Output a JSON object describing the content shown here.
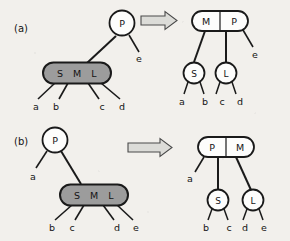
{
  "figure": {
    "colors": {
      "background": "#f2f0ec",
      "stroke": "#1a1a1a",
      "gray_node_fill": "#9c9c9c",
      "white_node_fill": "#fdfdfc",
      "arrow_fill": "#d8d8d4",
      "text": "#141414"
    },
    "panels": [
      {
        "id": "a",
        "label": "(a)",
        "arrow": "double-right-arrow",
        "arrow_glyph": "⟹",
        "before": {
          "nodes": [
            {
              "id": "a-before-p",
              "shape": "circle",
              "fill": "white",
              "keys": [
                "P"
              ]
            },
            {
              "id": "a-before-sml",
              "shape": "stadium",
              "fill": "gray",
              "keys": [
                "S",
                "M",
                "L"
              ]
            }
          ],
          "leaf_labels": [
            "a",
            "b",
            "c",
            "d"
          ],
          "side_labels": [
            "e"
          ]
        },
        "after": {
          "nodes": [
            {
              "id": "a-after-mp",
              "shape": "stadium",
              "fill": "white",
              "keys": [
                "M",
                "P"
              ]
            },
            {
              "id": "a-after-s",
              "shape": "circle",
              "fill": "white",
              "keys": [
                "S"
              ]
            },
            {
              "id": "a-after-l",
              "shape": "circle",
              "fill": "white",
              "keys": [
                "L"
              ]
            }
          ],
          "leaf_labels": [
            "a",
            "b",
            "c",
            "d"
          ],
          "side_labels": [
            "e"
          ]
        }
      },
      {
        "id": "b",
        "label": "(b)",
        "arrow": "double-right-arrow",
        "arrow_glyph": "⟹",
        "before": {
          "nodes": [
            {
              "id": "b-before-p",
              "shape": "circle",
              "fill": "white",
              "keys": [
                "P"
              ]
            },
            {
              "id": "b-before-sml",
              "shape": "stadium",
              "fill": "gray",
              "keys": [
                "S",
                "M",
                "L"
              ]
            }
          ],
          "leaf_labels": [
            "b",
            "c",
            "d",
            "e"
          ],
          "side_labels": [
            "a"
          ]
        },
        "after": {
          "nodes": [
            {
              "id": "b-after-pm",
              "shape": "stadium",
              "fill": "white",
              "keys": [
                "P",
                "M"
              ]
            },
            {
              "id": "b-after-s",
              "shape": "circle",
              "fill": "white",
              "keys": [
                "S"
              ]
            },
            {
              "id": "b-after-l",
              "shape": "circle",
              "fill": "white",
              "keys": [
                "L"
              ]
            }
          ],
          "leaf_labels": [
            "b",
            "c",
            "d",
            "e"
          ],
          "side_labels": [
            "a"
          ]
        }
      }
    ]
  }
}
